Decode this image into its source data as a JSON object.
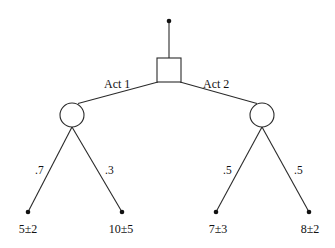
{
  "diagram": {
    "type": "decision-tree",
    "root": {
      "kind": "decision-node",
      "shape": "square"
    },
    "actions": [
      {
        "label": "Act 1",
        "chance_node": {
          "shape": "circle",
          "branches": [
            {
              "probability": ".7",
              "outcome": "5±2"
            },
            {
              "probability": ".3",
              "outcome": "10±5"
            }
          ]
        }
      },
      {
        "label": "Act 2",
        "chance_node": {
          "shape": "circle",
          "branches": [
            {
              "probability": ".5",
              "outcome": "7±3"
            },
            {
              "probability": ".5",
              "outcome": "8±2"
            }
          ]
        }
      }
    ],
    "colors": {
      "line": "#2a2a2a",
      "text": "#111111",
      "background": "#ffffff"
    }
  }
}
